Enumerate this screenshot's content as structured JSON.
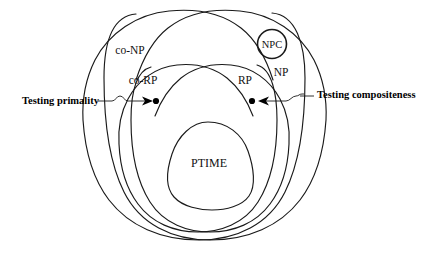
{
  "figure": {
    "type": "venn-diagram",
    "title": "",
    "background_color": "#ffffff",
    "stroke_color": "#1a1a1a",
    "text_color": "#111111"
  },
  "regions": [
    {
      "id": "co-np",
      "label": "co-NP",
      "label_x": 130,
      "label_y": 54
    },
    {
      "id": "np",
      "label": "NP",
      "label_x": 281,
      "label_y": 76
    },
    {
      "id": "co-rp",
      "label": "co-RP",
      "label_x": 143,
      "label_y": 84
    },
    {
      "id": "rp",
      "label": "RP",
      "label_x": 245,
      "label_y": 84
    },
    {
      "id": "npc",
      "label": "NPC",
      "label_x": 272,
      "label_y": 44
    },
    {
      "id": "ptime",
      "label": "PTIME",
      "label_x": 209,
      "label_y": 163
    }
  ],
  "callouts": [
    {
      "id": "testing-primality",
      "label": "Testing primality",
      "label_x": 22,
      "label_y": 104,
      "dot_x": 156,
      "dot_y": 101,
      "side": "left"
    },
    {
      "id": "testing-compositeness",
      "label": "Testing compositeness",
      "label_x": 320,
      "label_y": 98,
      "dot_x": 252,
      "dot_y": 101,
      "side": "right"
    }
  ],
  "points": [
    {
      "id": "primality-point",
      "x": 156,
      "y": 101
    },
    {
      "id": "compositeness-point",
      "x": 252,
      "y": 101
    }
  ]
}
